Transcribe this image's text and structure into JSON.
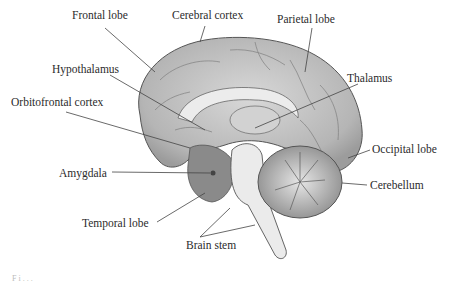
{
  "diagram": {
    "labels": [
      {
        "id": "frontal-lobe",
        "text": "Frontal lobe",
        "x": 72,
        "y": 10
      },
      {
        "id": "cerebral-cortex",
        "text": "Cerebral cortex",
        "x": 172,
        "y": 10
      },
      {
        "id": "parietal-lobe",
        "text": "Parietal lobe",
        "x": 277,
        "y": 14
      },
      {
        "id": "hypothalamus",
        "text": "Hypothalamus",
        "x": 52,
        "y": 64
      },
      {
        "id": "thalamus",
        "text": "Thalamus",
        "x": 347,
        "y": 73
      },
      {
        "id": "orbitofrontal-cortex",
        "text": "Orbitofrontal cortex",
        "x": 11,
        "y": 97
      },
      {
        "id": "occipital-lobe",
        "text": "Occipital lobe",
        "x": 372,
        "y": 144
      },
      {
        "id": "amygdala",
        "text": "Amygdala",
        "x": 59,
        "y": 168
      },
      {
        "id": "cerebellum",
        "text": "Cerebellum",
        "x": 370,
        "y": 180
      },
      {
        "id": "temporal-lobe",
        "text": "Temporal lobe",
        "x": 82,
        "y": 218
      },
      {
        "id": "brain-stem",
        "text": "Brain stem",
        "x": 186,
        "y": 240
      }
    ],
    "caption_fragment": "Fi..."
  }
}
